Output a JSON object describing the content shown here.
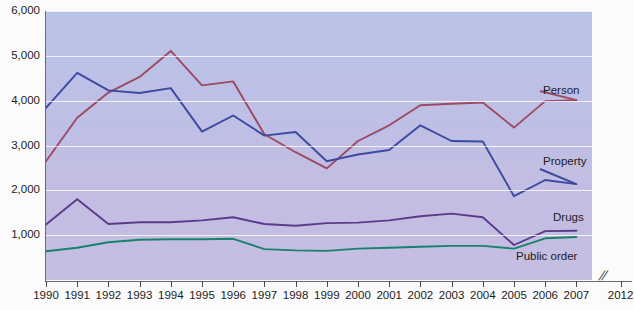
{
  "chart_data": {
    "type": "line",
    "title": "",
    "subtitle": "",
    "xlabel": "",
    "ylabel": "",
    "grid": true,
    "legend_position": "inline-right",
    "axis_break": "//",
    "x": [
      1990,
      1991,
      1992,
      1993,
      1994,
      1995,
      1996,
      1997,
      1998,
      1999,
      2000,
      2001,
      2002,
      2003,
      2004,
      2005,
      2006,
      2007
    ],
    "categories": [
      "1990",
      "1991",
      "1992",
      "1993",
      "1994",
      "1995",
      "1996",
      "1997",
      "1998",
      "1999",
      "2000",
      "2001",
      "2002",
      "2003",
      "2004",
      "2005",
      "2006",
      "2007"
    ],
    "extra_xticks": [
      "2012"
    ],
    "ylim": [
      0,
      6000
    ],
    "yticks": [
      1000,
      2000,
      3000,
      4000,
      5000,
      6000
    ],
    "ytick_labels": [
      "1,000",
      "2,000",
      "3,000",
      "4,000",
      "5,000",
      "6,000"
    ],
    "series": [
      {
        "name": "Person",
        "color": "#9c4a61",
        "values": [
          2650,
          3620,
          4180,
          4530,
          5110,
          4340,
          4430,
          3250,
          2850,
          2490,
          3100,
          3450,
          3900,
          3930,
          3960,
          3400,
          3990,
          4010
        ]
      },
      {
        "name": "Property",
        "color": "#3b4a9e",
        "values": [
          3840,
          4620,
          4230,
          4170,
          4280,
          3310,
          3670,
          3220,
          3300,
          2650,
          2800,
          2900,
          3450,
          3100,
          3090,
          1870,
          2230,
          2140
        ]
      },
      {
        "name": "Drugs",
        "color": "#5b3a8e",
        "values": [
          1240,
          1800,
          1250,
          1290,
          1290,
          1330,
          1400,
          1250,
          1210,
          1270,
          1280,
          1330,
          1420,
          1480,
          1400,
          780,
          1090,
          1100
        ]
      },
      {
        "name": "Public order",
        "color": "#17836b",
        "values": [
          640,
          720,
          840,
          900,
          910,
          910,
          920,
          690,
          660,
          650,
          700,
          720,
          740,
          760,
          760,
          700,
          930,
          960
        ]
      }
    ]
  },
  "labels": {
    "person": "Person",
    "property": "Property",
    "drugs": "Drugs",
    "public_order": "Public order"
  },
  "colors": {
    "person": "#9c4a61",
    "property": "#3b4a9e",
    "drugs": "#5b3a8e",
    "public_order": "#17836b",
    "plot_background_top": "#b9c2e8",
    "plot_background_bottom": "#c6bde2",
    "gridline": "#ffffff",
    "axis": "#6a6a6a",
    "text": "#1c1c1c"
  }
}
